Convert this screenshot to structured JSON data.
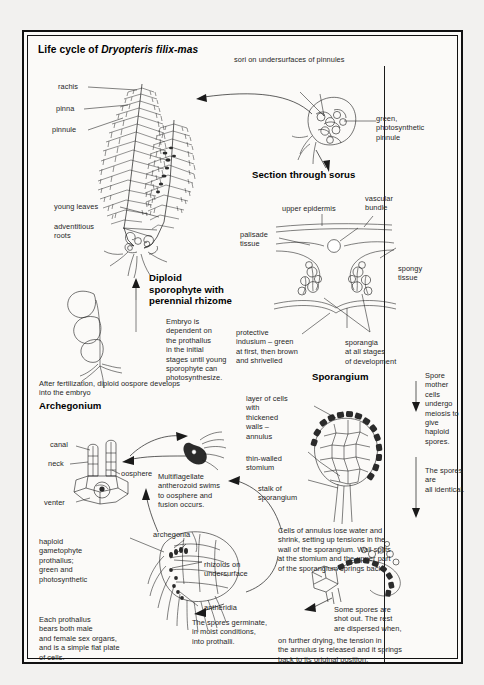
{
  "document": {
    "title_prefix": "Life cycle of ",
    "title_species": "Dryopteris filix-mas"
  },
  "headings": {
    "section_sorus": "Section through sorus",
    "sporangium": "Sporangium",
    "diploid_sporophyte": "Diploid\nsporophyte with\nperennial rhizome",
    "archegonium": "Archegonium"
  },
  "fern_labels": {
    "rachis": "rachis",
    "pinna": "pinna",
    "pinnule": "pinnule",
    "young_leaves": "young leaves",
    "adventitious_roots": "adventitious\nroots"
  },
  "pinnule_labels": {
    "sori": "sori on undersurfaces of pinnules",
    "green_photosynthetic": "green,\nphotosynthetic\npinnule"
  },
  "sorus_labels": {
    "upper_epidermis": "upper epidermis",
    "vascular_bundle": "vascular\nbundle",
    "palisade_tissue": "palisade\ntissue",
    "spongy_tissue": "spongy\ntissue",
    "protective_indusium": "protective\nindusium – green\nat first, then brown\nand shrivelled",
    "sporangia_stages": "sporangia\nat all stages\nof development"
  },
  "sporangium_labels": {
    "annulus": "layer of cells\nwith\nthickened\nwalls –\nannulus",
    "stomium": "thin-walled\nstomium",
    "stalk": "stalk of\nsporangium",
    "spore_mother_cells": "Spore mother\ncells undergo\nmeiosis to\ngive haploid\nspores.",
    "spores_identical": "The spores are\nall identical."
  },
  "sporophyte_text": {
    "embryo_dependent": "Embryo is\ndependent on\nthe prothallus\nin the initial\nstages until young\nsporophyte can\nphotosynthesize.",
    "after_fertilization": "After fertilization, diploid oospore develops\ninto the embryo"
  },
  "archegonium_labels": {
    "canal": "canal",
    "neck": "neck",
    "oosphere": "oosphere",
    "venter": "venter",
    "multiflagellate": "Multiflagellate\nantherozoid swims\nto oosphere and\nfusion occurs."
  },
  "prothallus_labels": {
    "haploid_gametophyte": "haploid\ngametophyte\nprothallus;\ngreen and\nphotosynthetic",
    "archegonia": "archegonia",
    "rhizoids": "rhizoids on\nundersurface",
    "antheridia": "antheridia",
    "each_prothallus": "Each prothallus\nbears both male\nand female sex organs,\nand is a simple flat plate\nof cells.",
    "spores_germinate": "The spores germinate,\nin moist conditions,\ninto prothalli."
  },
  "annulus_text": {
    "cells_lose_water": "Cells of annulus lose water and\nshrink, setting up tensions in the\nwall of the sporangium. Wall splits\nat the stomium and the upper part\nof the sporangium springs back.",
    "some_spores": "Some spores are\nshot out. The rest\nare dispersed when,",
    "on_further_drying": "on further drying, the tension in\nthe annulus is released and it springs\nback to its original position."
  },
  "colors": {
    "page_background": "#f2f1ef",
    "panel_background": "#fbfaf8",
    "ink": "#1a1a1a",
    "text": "#262626"
  }
}
